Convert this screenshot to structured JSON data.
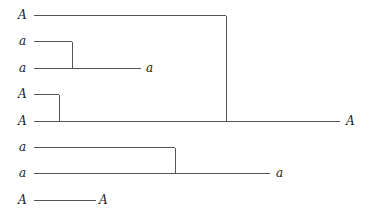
{
  "diagram": {
    "type": "tree",
    "leaves": [
      {
        "id": "leaf1",
        "label": "A"
      },
      {
        "id": "leaf2",
        "label": "a"
      },
      {
        "id": "leaf3",
        "label": "a"
      },
      {
        "id": "leaf4",
        "label": "A"
      },
      {
        "id": "leaf5",
        "label": "A"
      },
      {
        "id": "leaf6",
        "label": "a"
      },
      {
        "id": "leaf7",
        "label": "a"
      },
      {
        "id": "leaf8",
        "label": "A"
      }
    ],
    "merges": [
      {
        "id": "m1",
        "inputs": [
          "leaf2",
          "leaf3"
        ],
        "result": "a"
      },
      {
        "id": "m2",
        "inputs": [
          "leaf4",
          "leaf5"
        ],
        "result": null
      },
      {
        "id": "m3",
        "inputs": [
          "leaf1",
          "m2"
        ],
        "result": "A"
      },
      {
        "id": "m4",
        "inputs": [
          "leaf6",
          "leaf7"
        ],
        "result": "a"
      },
      {
        "id": "m5",
        "inputs": [
          "leaf8"
        ],
        "result": "A"
      }
    ]
  }
}
